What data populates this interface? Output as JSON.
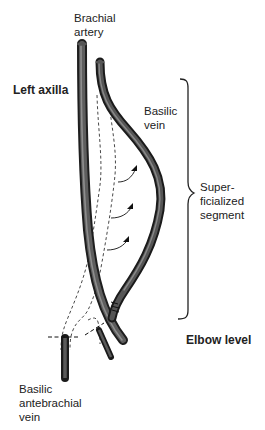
{
  "diagram": {
    "labels": {
      "brachial_artery": "Brachial\nartery",
      "left_axilla": "Left axilla",
      "basilic_vein": "Basilic\nvein",
      "superficialized_segment": "Super-\nficialized\nsegment",
      "elbow_level": "Elbow level",
      "basilic_antebrachial_vein": "Basilic\nantebrachial\nvein"
    },
    "colors": {
      "vessel_dark": "#2a2a2a",
      "vessel_mid": "#555555",
      "vessel_highlight": "#8a8a8a",
      "line": "#222222",
      "background": "#ffffff"
    }
  }
}
